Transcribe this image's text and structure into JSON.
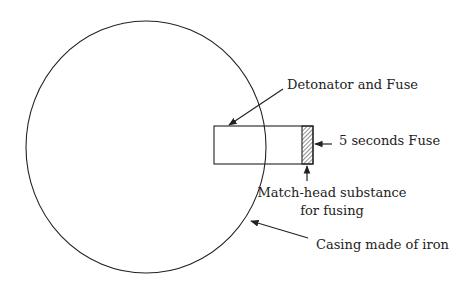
{
  "diagram": {
    "labels": {
      "detonator": "Detonator and Fuse",
      "fuse": "5 seconds Fuse",
      "match_head_line1": "Match-head substance",
      "match_head_line2": "for fusing",
      "casing": "Casing made of iron"
    },
    "colors": {
      "stroke": "#222222",
      "background": "#ffffff"
    }
  }
}
